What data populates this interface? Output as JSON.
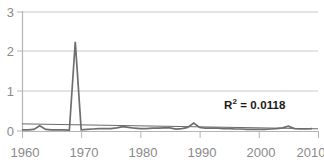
{
  "chart_data": {
    "type": "line",
    "title": "",
    "xlabel": "",
    "ylabel": "",
    "xlim": [
      1960,
      2010
    ],
    "ylim": [
      0,
      3
    ],
    "grid": true,
    "legend": false,
    "y_ticks": [
      "0",
      "1",
      "2",
      "3"
    ],
    "y_tick_values": [
      0,
      1,
      2,
      3
    ],
    "x_ticks": [
      "1960",
      "1970",
      "1980",
      "1990",
      "2000",
      "2010"
    ],
    "x_tick_values": [
      1960,
      1970,
      1980,
      1990,
      2000,
      2010
    ],
    "annotations": [
      {
        "name": "r-squared",
        "text_prefix": "R",
        "text_sup": "2",
        "text_suffix": " = 0.0118",
        "value": 0.0118
      }
    ],
    "series": [
      {
        "name": "data",
        "color": "#6e6e6e",
        "x": [
          1960,
          1961,
          1962,
          1963,
          1964,
          1965,
          1966,
          1967,
          1968,
          1969,
          1970,
          1971,
          1972,
          1973,
          1974,
          1975,
          1976,
          1977,
          1978,
          1979,
          1980,
          1981,
          1982,
          1983,
          1984,
          1985,
          1986,
          1987,
          1988,
          1989,
          1990,
          1991,
          1992,
          1993,
          1994,
          1995,
          1996,
          1997,
          1998,
          1999,
          2000,
          2001,
          2002,
          2003,
          2004,
          2005,
          2006,
          2007,
          2008,
          2009
        ],
        "values": [
          0.03,
          0.03,
          0.04,
          0.13,
          0.04,
          0.03,
          0.03,
          0.03,
          0.02,
          2.25,
          0.03,
          0.04,
          0.05,
          0.06,
          0.06,
          0.06,
          0.08,
          0.11,
          0.09,
          0.07,
          0.06,
          0.06,
          0.07,
          0.07,
          0.08,
          0.08,
          0.05,
          0.06,
          0.09,
          0.2,
          0.09,
          0.07,
          0.07,
          0.07,
          0.06,
          0.06,
          0.05,
          0.05,
          0.04,
          0.04,
          0.04,
          0.04,
          0.05,
          0.06,
          0.08,
          0.12,
          0.06,
          0.05,
          0.05,
          0.06
        ]
      },
      {
        "name": "trendline",
        "color": "#595959",
        "x": [
          1960,
          2010
        ],
        "values": [
          0.18,
          0.055
        ]
      }
    ]
  },
  "axes": {
    "axis_color": "#b4b4b4",
    "grid_color": "#c8c8c8",
    "tick_label_color": "#8a8a8a"
  },
  "title_remnant": {
    "text": ""
  }
}
